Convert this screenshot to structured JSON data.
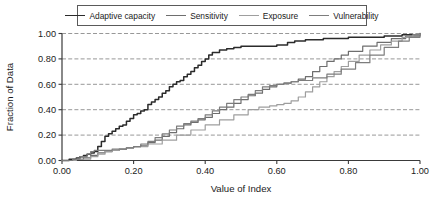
{
  "chart_data": {
    "type": "line",
    "title": "",
    "xlabel": "Value of Index",
    "ylabel": "Fraction of Data",
    "xlim": [
      0.0,
      1.0
    ],
    "ylim": [
      0.0,
      1.0
    ],
    "xticks": [
      "0.00",
      "0.20",
      "0.40",
      "0.60",
      "0.80",
      "1.00"
    ],
    "yticks": [
      "0.00",
      "0.20",
      "0.40",
      "0.60",
      "0.80",
      "1.00"
    ],
    "xtick_values": [
      0.0,
      0.2,
      0.4,
      0.6,
      0.8,
      1.0
    ],
    "ytick_values": [
      0.0,
      0.2,
      0.4,
      0.6,
      0.8,
      1.0
    ],
    "grid": "horizontal-dashed",
    "legend_position": "top-center",
    "series": [
      {
        "name": "Adaptive capacity",
        "color": "#2b2b2b",
        "x": [
          0.0,
          0.02,
          0.04,
          0.05,
          0.06,
          0.07,
          0.08,
          0.09,
          0.1,
          0.11,
          0.12,
          0.13,
          0.14,
          0.15,
          0.16,
          0.17,
          0.18,
          0.19,
          0.2,
          0.21,
          0.22,
          0.23,
          0.24,
          0.25,
          0.26,
          0.27,
          0.28,
          0.29,
          0.3,
          0.31,
          0.32,
          0.33,
          0.34,
          0.35,
          0.36,
          0.37,
          0.38,
          0.39,
          0.4,
          0.41,
          0.42,
          0.44,
          0.46,
          0.48,
          0.5,
          0.55,
          0.6,
          0.63,
          0.65,
          0.68,
          0.7,
          0.73,
          0.75,
          0.8,
          0.85,
          0.9,
          0.95,
          1.0
        ],
        "y": [
          0.0,
          0.01,
          0.02,
          0.03,
          0.04,
          0.05,
          0.06,
          0.07,
          0.11,
          0.15,
          0.19,
          0.21,
          0.23,
          0.25,
          0.27,
          0.28,
          0.31,
          0.33,
          0.36,
          0.37,
          0.39,
          0.4,
          0.44,
          0.46,
          0.48,
          0.5,
          0.53,
          0.55,
          0.58,
          0.6,
          0.62,
          0.63,
          0.66,
          0.68,
          0.7,
          0.73,
          0.75,
          0.78,
          0.8,
          0.83,
          0.85,
          0.87,
          0.88,
          0.89,
          0.9,
          0.9,
          0.91,
          0.93,
          0.94,
          0.95,
          0.95,
          0.96,
          0.96,
          0.97,
          0.97,
          0.98,
          0.99,
          1.0
        ]
      },
      {
        "name": "Sensitivity",
        "color": "#6e6e6e",
        "x": [
          0.0,
          0.03,
          0.06,
          0.08,
          0.1,
          0.12,
          0.14,
          0.16,
          0.18,
          0.2,
          0.22,
          0.24,
          0.26,
          0.28,
          0.3,
          0.32,
          0.34,
          0.36,
          0.38,
          0.4,
          0.42,
          0.44,
          0.46,
          0.48,
          0.5,
          0.52,
          0.54,
          0.56,
          0.58,
          0.6,
          0.62,
          0.64,
          0.66,
          0.68,
          0.7,
          0.72,
          0.74,
          0.76,
          0.78,
          0.8,
          0.84,
          0.88,
          0.92,
          0.96,
          1.0
        ],
        "y": [
          0.0,
          0.01,
          0.02,
          0.04,
          0.06,
          0.07,
          0.08,
          0.09,
          0.1,
          0.11,
          0.12,
          0.14,
          0.16,
          0.19,
          0.22,
          0.25,
          0.28,
          0.3,
          0.32,
          0.34,
          0.37,
          0.4,
          0.42,
          0.45,
          0.48,
          0.51,
          0.53,
          0.56,
          0.58,
          0.6,
          0.61,
          0.62,
          0.64,
          0.66,
          0.7,
          0.74,
          0.78,
          0.8,
          0.83,
          0.86,
          0.9,
          0.93,
          0.96,
          0.98,
          1.0
        ]
      },
      {
        "name": "Exposure",
        "color": "#9e9e9e",
        "x": [
          0.0,
          0.04,
          0.08,
          0.1,
          0.12,
          0.14,
          0.16,
          0.18,
          0.2,
          0.24,
          0.28,
          0.32,
          0.36,
          0.4,
          0.44,
          0.48,
          0.52,
          0.55,
          0.58,
          0.6,
          0.62,
          0.64,
          0.66,
          0.68,
          0.7,
          0.72,
          0.74,
          0.76,
          0.78,
          0.8,
          0.83,
          0.86,
          0.89,
          0.92,
          0.95,
          0.98,
          1.0
        ],
        "y": [
          0.0,
          0.01,
          0.03,
          0.05,
          0.07,
          0.08,
          0.09,
          0.1,
          0.11,
          0.13,
          0.16,
          0.2,
          0.24,
          0.28,
          0.32,
          0.36,
          0.4,
          0.42,
          0.43,
          0.44,
          0.45,
          0.47,
          0.5,
          0.54,
          0.58,
          0.62,
          0.66,
          0.7,
          0.74,
          0.78,
          0.83,
          0.87,
          0.91,
          0.94,
          0.97,
          0.99,
          1.0
        ]
      },
      {
        "name": "Vulnerability",
        "color": "#7d7d7d",
        "x": [
          0.0,
          0.03,
          0.05,
          0.07,
          0.08,
          0.09,
          0.1,
          0.12,
          0.14,
          0.16,
          0.18,
          0.2,
          0.22,
          0.24,
          0.26,
          0.28,
          0.3,
          0.32,
          0.34,
          0.36,
          0.38,
          0.4,
          0.42,
          0.44,
          0.46,
          0.48,
          0.5,
          0.52,
          0.54,
          0.56,
          0.58,
          0.6,
          0.62,
          0.64,
          0.66,
          0.7,
          0.74,
          0.78,
          0.82,
          0.86,
          0.9,
          0.94,
          0.97,
          1.0
        ],
        "y": [
          0.0,
          0.01,
          0.03,
          0.05,
          0.07,
          0.08,
          0.08,
          0.08,
          0.09,
          0.09,
          0.1,
          0.11,
          0.13,
          0.15,
          0.18,
          0.21,
          0.24,
          0.27,
          0.29,
          0.31,
          0.33,
          0.36,
          0.39,
          0.42,
          0.45,
          0.48,
          0.5,
          0.52,
          0.55,
          0.58,
          0.59,
          0.6,
          0.61,
          0.62,
          0.63,
          0.65,
          0.68,
          0.72,
          0.77,
          0.83,
          0.89,
          0.94,
          0.97,
          1.0
        ]
      }
    ]
  },
  "legend": {
    "items": [
      {
        "label": "Adaptive capacity",
        "color": "#2b2b2b"
      },
      {
        "label": "Sensitivity",
        "color": "#6e6e6e"
      },
      {
        "label": "Exposure",
        "color": "#9e9e9e"
      },
      {
        "label": "Vulnerability",
        "color": "#7d7d7d"
      }
    ]
  },
  "colors": {
    "axis": "#3a3a3a",
    "grid": "#8c8c8c",
    "text": "#1a1a1a",
    "background": "#ffffff"
  }
}
